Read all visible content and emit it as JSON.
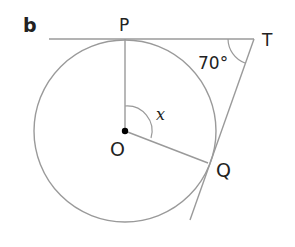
{
  "part_label": "b",
  "points": {
    "P": "P",
    "T": "T",
    "O": "O",
    "Q": "Q"
  },
  "angles": {
    "angle_T": "70°",
    "angle_x": "x"
  },
  "colors": {
    "line": "#9a9a9a",
    "text": "#222222",
    "center_dot": "#000000"
  }
}
